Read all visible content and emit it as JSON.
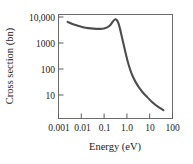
{
  "chart_data": {
    "type": "line",
    "title": "",
    "xlabel": "Energy (eV)",
    "ylabel": "Cross section (bn)",
    "xscale": "log",
    "yscale": "log",
    "xlim": [
      0.001,
      100
    ],
    "ylim": [
      1,
      10000
    ],
    "grid": false,
    "legend": null,
    "xticks": [
      0.001,
      0.01,
      0.1,
      1.0,
      10,
      100
    ],
    "xtick_labels": [
      "0.001",
      "0.01",
      "0.1",
      "1.0",
      "10",
      "100"
    ],
    "yticks": [
      10,
      100,
      1000,
      10000
    ],
    "ytick_labels": [
      "10",
      "100",
      "1000",
      "10,000"
    ],
    "series": [
      {
        "name": "neutron capture cross section",
        "color": "#4d4d4d",
        "x": [
          0.0025,
          0.004,
          0.007,
          0.012,
          0.02,
          0.035,
          0.06,
          0.1,
          0.17,
          0.25,
          0.3,
          0.35,
          0.42,
          0.5,
          0.6,
          0.75,
          0.9,
          1.1,
          1.4,
          1.8,
          2.5,
          3.5,
          5.0,
          8.0,
          13.0,
          22.0,
          40.0
        ],
        "y": [
          5200,
          4300,
          3700,
          3250,
          3000,
          2850,
          2800,
          2900,
          3600,
          5600,
          6500,
          6300,
          4800,
          2800,
          1400,
          600,
          300,
          150,
          75,
          42,
          24,
          15,
          10,
          6.5,
          4.2,
          2.9,
          2.1
        ]
      }
    ],
    "annotations": []
  }
}
